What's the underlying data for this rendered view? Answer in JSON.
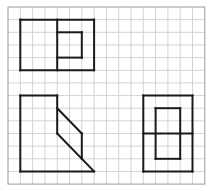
{
  "diagram": {
    "type": "three-view-drawing-on-grid",
    "grid": {
      "columns": 16,
      "rows": 14,
      "origin_x": 8,
      "origin_y": 7,
      "cell_w": 12.3,
      "cell_h": 12.65,
      "grid_color": "#d4d4d4",
      "border_color": "#9a9a9a",
      "line_color": "#1a1a1a"
    },
    "views": [
      {
        "name": "front-view",
        "segments": [
          [
            [
              1,
              1
            ],
            [
              7,
              1
            ]
          ],
          [
            [
              7,
              1
            ],
            [
              7,
              5
            ]
          ],
          [
            [
              7,
              5
            ],
            [
              1,
              5
            ]
          ],
          [
            [
              1,
              5
            ],
            [
              1,
              1
            ]
          ],
          [
            [
              4,
              1
            ],
            [
              4,
              5
            ]
          ],
          [
            [
              4,
              2
            ],
            [
              6,
              2
            ]
          ],
          [
            [
              6,
              2
            ],
            [
              6,
              4
            ]
          ],
          [
            [
              6,
              4
            ],
            [
              4,
              4
            ]
          ]
        ]
      },
      {
        "name": "side-view",
        "segments": [
          [
            [
              1,
              7
            ],
            [
              4,
              7
            ]
          ],
          [
            [
              4,
              7
            ],
            [
              4,
              10
            ]
          ],
          [
            [
              4,
              10
            ],
            [
              7,
              13
            ]
          ],
          [
            [
              7,
              13
            ],
            [
              1,
              13
            ]
          ],
          [
            [
              1,
              13
            ],
            [
              1,
              7
            ]
          ],
          [
            [
              4,
              8
            ],
            [
              6,
              10
            ]
          ],
          [
            [
              6,
              10
            ],
            [
              6,
              12
            ]
          ]
        ]
      },
      {
        "name": "top-view",
        "segments": [
          [
            [
              11,
              7
            ],
            [
              15,
              7
            ]
          ],
          [
            [
              15,
              7
            ],
            [
              15,
              13
            ]
          ],
          [
            [
              15,
              13
            ],
            [
              11,
              13
            ]
          ],
          [
            [
              11,
              13
            ],
            [
              11,
              7
            ]
          ],
          [
            [
              11,
              10
            ],
            [
              15,
              10
            ]
          ],
          [
            [
              12,
              8
            ],
            [
              14,
              8
            ]
          ],
          [
            [
              14,
              8
            ],
            [
              14,
              12
            ]
          ],
          [
            [
              14,
              12
            ],
            [
              12,
              12
            ]
          ],
          [
            [
              12,
              12
            ],
            [
              12,
              8
            ]
          ]
        ]
      }
    ]
  }
}
